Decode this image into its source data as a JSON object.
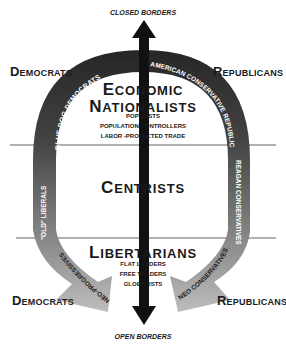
{
  "diagram": {
    "axis": {
      "top_label": "CLOSED BORDERS",
      "bottom_label": "OPEN BORDERS"
    },
    "parties": {
      "left_top": {
        "initial": "D",
        "rest": "EMOCRATS"
      },
      "right_top": {
        "initial": "R",
        "rest": "EPUBLICANS"
      },
      "left_bottom": {
        "initial": "D",
        "rest": "EMOCRATS"
      },
      "right_bottom": {
        "initial": "R",
        "rest": "EPUBLICANS"
      }
    },
    "arc_labels": {
      "left_upper": "BLUE DOG DEMOCRATS",
      "left_middle": "\"OLD\" LIBERALS",
      "left_lower": "NEO-PROGRESSIVES",
      "right_upper": "AMERICAN CONSERVATIVE REPUBLICANS",
      "right_middle": "REAGAN CONSERVATIVES",
      "right_lower": "NEO CONSERVATIVES"
    },
    "groups": {
      "economic_nationalists": {
        "line1": {
          "initial": "E",
          "rest": "CONOMIC"
        },
        "line2": {
          "initial": "N",
          "rest": "ATIONALISTS"
        },
        "items": [
          "POPULISTS",
          "POPULATION CONTROLLERS",
          "LABOR -PROTECTED TRADE"
        ]
      },
      "centrists": {
        "title": {
          "initial": "C",
          "rest": "ENTRISTS"
        }
      },
      "libertarians": {
        "title": {
          "initial": "L",
          "rest": "IBERTARIANS"
        },
        "items": [
          "FLAT LANDERS",
          "FREE TRADERS",
          "GLOBALISTS"
        ]
      }
    },
    "colors": {
      "arc_dark": "#2e2e2e",
      "arc_mid": "#6a6a6a",
      "arc_light": "#b4b4b4",
      "axis_arrow": "#111111",
      "divider": "#333333"
    }
  }
}
